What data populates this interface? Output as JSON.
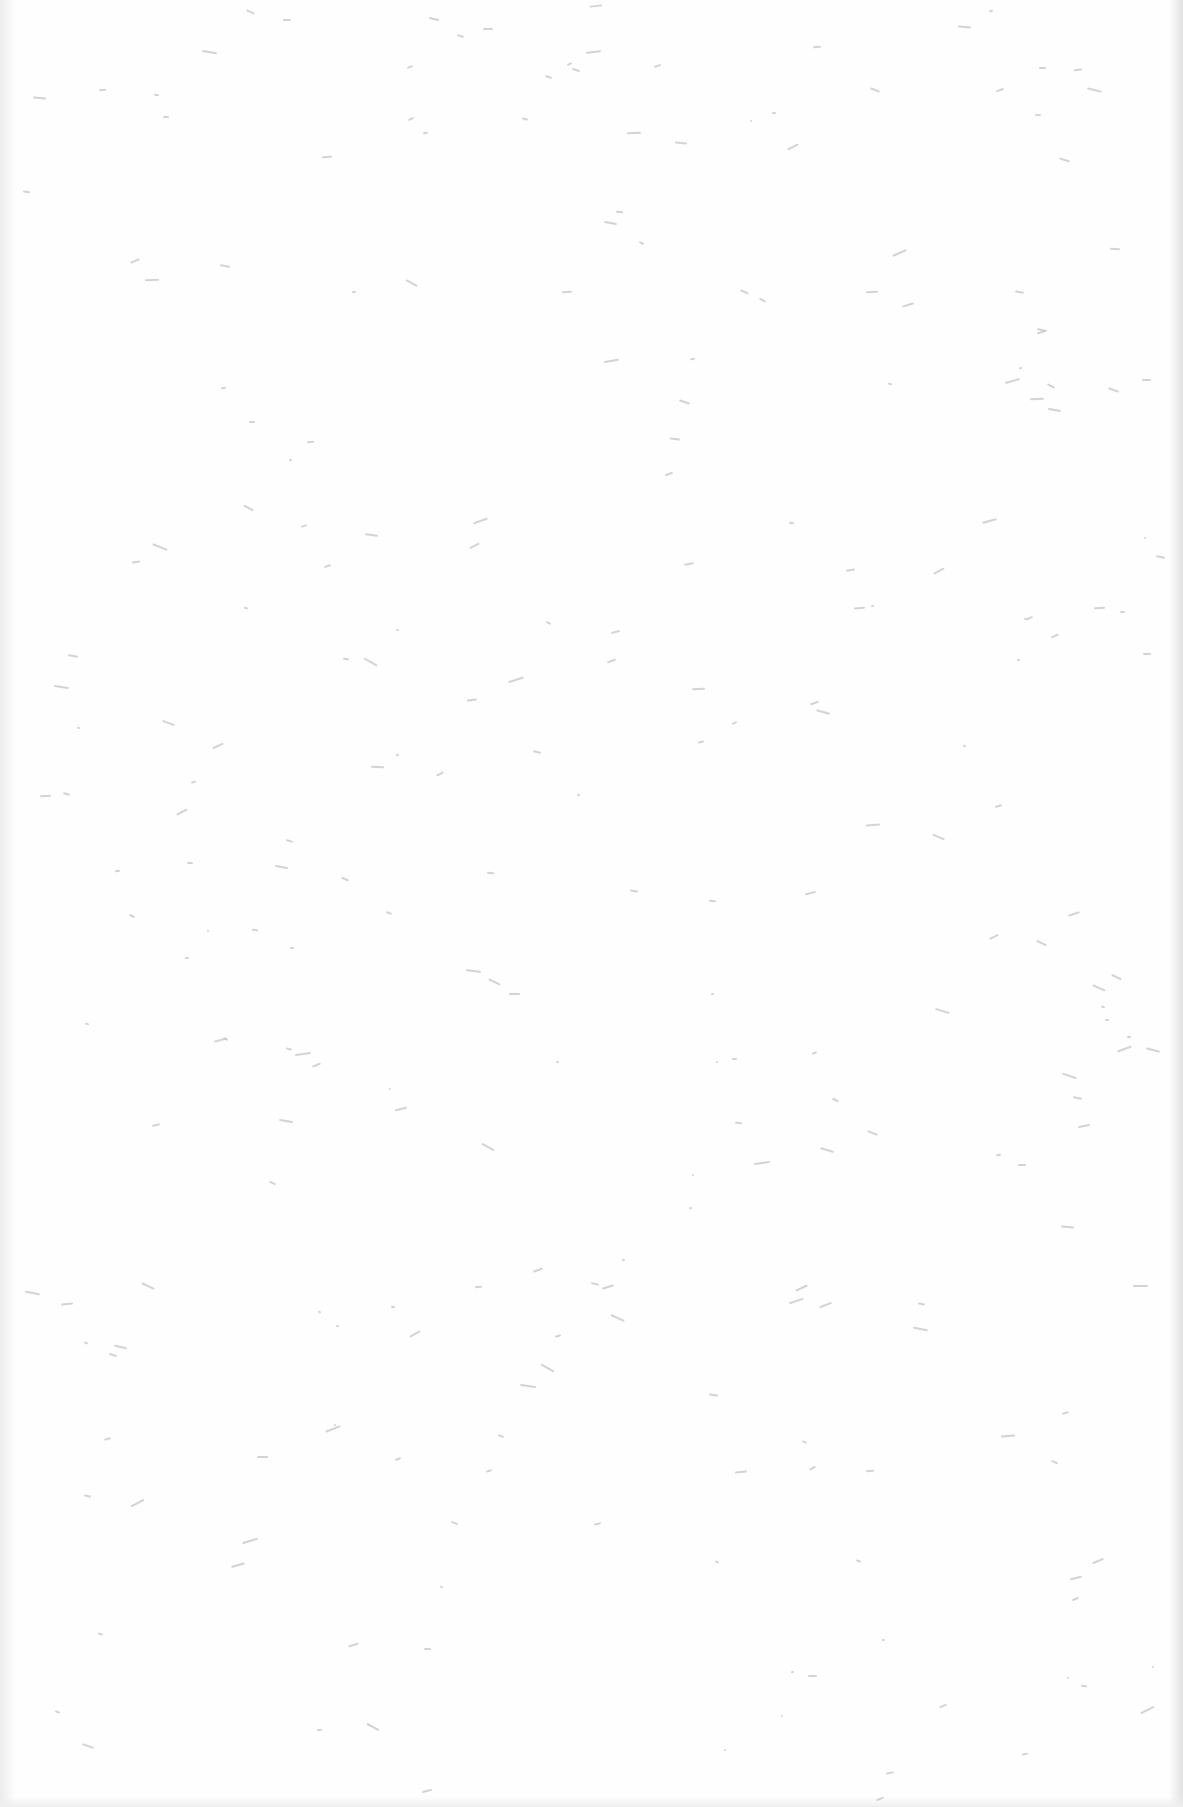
{
  "page": {
    "type": "blank scanned page",
    "background_color": "#fefefe",
    "speck_color": "#c8c8c8",
    "text": ""
  }
}
